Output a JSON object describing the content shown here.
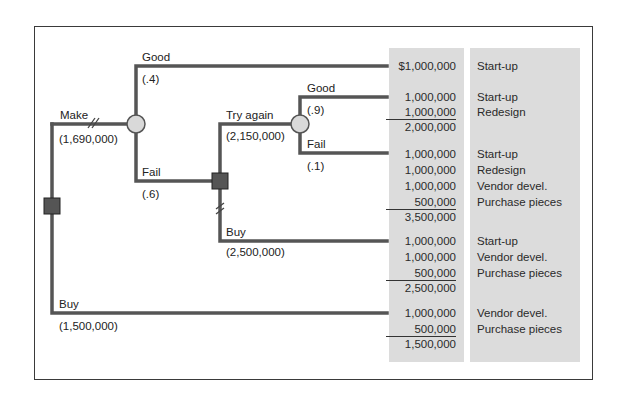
{
  "diagram": {
    "type": "decision-tree",
    "colors": {
      "branch": "#555555",
      "decision_node": "#555555",
      "chance_node": "#d9d9d9",
      "outcome_column": "#dcdcdc",
      "frame": "#3a3a3a"
    },
    "branches": {
      "make": {
        "label": "Make",
        "value": "(1,690,000)"
      },
      "good1": {
        "label": "Good",
        "prob": "(.4)"
      },
      "fail1": {
        "label": "Fail",
        "prob": "(.6)"
      },
      "try_again": {
        "label": "Try again",
        "value": "(2,150,000)"
      },
      "good2": {
        "label": "Good",
        "prob": "(.9)"
      },
      "fail2": {
        "label": "Fail",
        "prob": "(.1)"
      },
      "buy2": {
        "label": "Buy",
        "value": "(2,500,000)"
      },
      "buy1": {
        "label": "Buy",
        "value": "(1,500,000)"
      }
    },
    "outcomes": [
      {
        "lines": [
          {
            "amount": "$1,000,000",
            "desc": "Start-up"
          }
        ],
        "total": null
      },
      {
        "lines": [
          {
            "amount": "1,000,000",
            "desc": "Start-up"
          },
          {
            "amount": "1,000,000",
            "desc": "Redesign"
          }
        ],
        "total": "2,000,000"
      },
      {
        "lines": [
          {
            "amount": "1,000,000",
            "desc": "Start-up"
          },
          {
            "amount": "1,000,000",
            "desc": "Redesign"
          },
          {
            "amount": "1,000,000",
            "desc": "Vendor devel."
          },
          {
            "amount": "500,000",
            "desc": "Purchase pieces"
          }
        ],
        "total": "3,500,000"
      },
      {
        "lines": [
          {
            "amount": "1,000,000",
            "desc": "Start-up"
          },
          {
            "amount": "1,000,000",
            "desc": "Vendor devel."
          },
          {
            "amount": "500,000",
            "desc": "Purchase pieces"
          }
        ],
        "total": "2,500,000"
      },
      {
        "lines": [
          {
            "amount": "1,000,000",
            "desc": "Vendor devel."
          },
          {
            "amount": "500,000",
            "desc": "Purchase pieces"
          }
        ],
        "total": "1,500,000"
      }
    ]
  }
}
